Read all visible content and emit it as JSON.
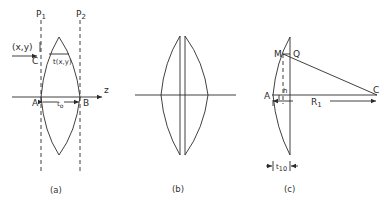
{
  "figure": {
    "panels": [
      {
        "id": "a",
        "caption": "(a)",
        "labels": {
          "plane1": "P",
          "plane1_sub": "1",
          "plane2": "P",
          "plane2_sub": "2",
          "point": "(x,y)",
          "ray": "C",
          "thickness_fn": "t(x,y)",
          "axis": "z",
          "vertex_left": "A",
          "vertex_right": "B",
          "center_thickness": "t",
          "center_thickness_sub": "o"
        }
      },
      {
        "id": "b",
        "caption": "(b)",
        "labels": {}
      },
      {
        "id": "c",
        "caption": "(c)",
        "labels": {
          "point_m": "M",
          "point_q": "Q",
          "center": "C",
          "vertex": "A",
          "height": "h",
          "radius": "R",
          "radius_sub": "1",
          "thickness": "t",
          "thickness_sub": "10"
        }
      }
    ]
  }
}
